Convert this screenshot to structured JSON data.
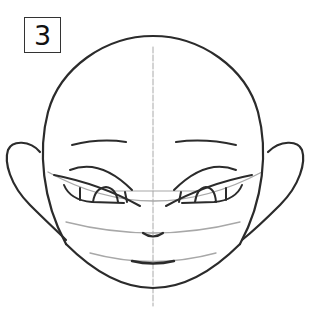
{
  "step": {
    "number": "3"
  },
  "drawing": {
    "subject": "cartoon face with pointed ears, step 3",
    "colors": {
      "ink": "#2b2b2b",
      "guide": "#a8a8a8",
      "background": "#ffffff"
    }
  }
}
